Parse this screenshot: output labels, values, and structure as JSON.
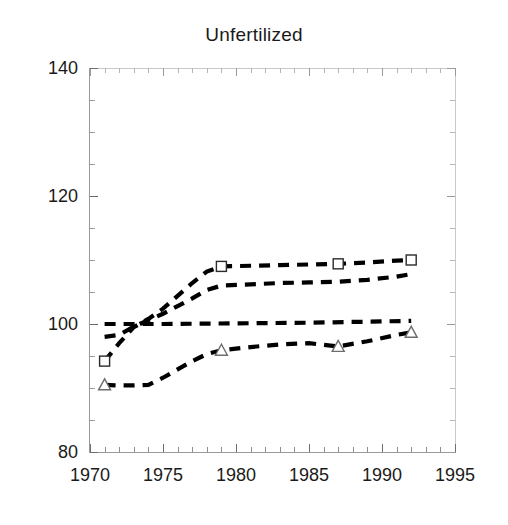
{
  "chart_data": {
    "type": "line",
    "title": "Unfertilized",
    "xlabel": "",
    "ylabel": "",
    "xlim": [
      1970,
      1995
    ],
    "ylim": [
      80,
      140
    ],
    "grid": false,
    "legend": "none",
    "x_ticks": [
      1970,
      1975,
      1980,
      1985,
      1990,
      1995
    ],
    "y_ticks": [
      80,
      100,
      120,
      140
    ],
    "x_minor_tick_step": 1,
    "y_minor_tick_step": 5,
    "line_style": "dashed",
    "series": [
      {
        "name": "series-1-squares",
        "marker": "square",
        "x": [
          1971,
          1972,
          1973,
          1974,
          1975,
          1976,
          1977,
          1978,
          1979,
          1981,
          1983,
          1985,
          1987,
          1989,
          1991,
          1992
        ],
        "values": [
          94.2,
          97.0,
          99.5,
          100.8,
          102.4,
          104.4,
          106.4,
          108.2,
          109.0,
          109.1,
          109.2,
          109.3,
          109.4,
          109.6,
          109.9,
          110.0
        ],
        "marker_x": [
          1971,
          1979,
          1987,
          1992
        ],
        "marker_values": [
          94.2,
          109.0,
          109.4,
          110.0
        ]
      },
      {
        "name": "series-2-plain",
        "marker": "none",
        "x": [
          1971,
          1972,
          1973,
          1974,
          1975,
          1976,
          1977,
          1978,
          1979,
          1981,
          1983,
          1985,
          1987,
          1989,
          1991,
          1992
        ],
        "values": [
          98.0,
          98.3,
          99.6,
          100.6,
          101.6,
          102.8,
          104.0,
          105.3,
          106.0,
          106.2,
          106.4,
          106.5,
          106.6,
          106.9,
          107.4,
          107.8
        ],
        "marker_x": [],
        "marker_values": []
      },
      {
        "name": "series-3-flat",
        "marker": "none",
        "x": [
          1971,
          1975,
          1980,
          1985,
          1990,
          1992
        ],
        "values": [
          100.0,
          100.0,
          100.1,
          100.2,
          100.4,
          100.5
        ],
        "marker_x": [],
        "marker_values": []
      },
      {
        "name": "series-4-triangles",
        "marker": "triangle",
        "x": [
          1971,
          1972,
          1973,
          1974,
          1975,
          1976,
          1977,
          1978,
          1979,
          1981,
          1983,
          1985,
          1987,
          1989,
          1991,
          1992
        ],
        "values": [
          90.5,
          90.4,
          90.4,
          90.5,
          91.6,
          92.9,
          94.2,
          95.3,
          95.9,
          96.4,
          96.8,
          97.0,
          96.5,
          97.3,
          98.3,
          98.7
        ],
        "marker_x": [
          1971,
          1979,
          1987,
          1992
        ],
        "marker_values": [
          90.5,
          95.9,
          96.5,
          98.7
        ]
      }
    ]
  },
  "axes": {
    "y_tick_labels": [
      "140",
      "120",
      "100",
      "80"
    ],
    "x_tick_labels": [
      "1970",
      "1975",
      "1980",
      "1985",
      "1990",
      "1995"
    ]
  }
}
